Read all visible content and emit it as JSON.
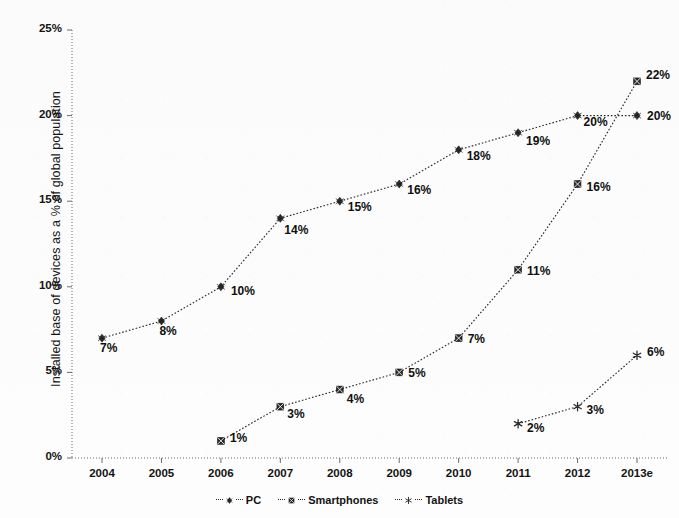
{
  "chart_data": {
    "type": "line",
    "title": "",
    "subtitle": "",
    "xlabel": "",
    "ylabel": "Installed base of devices as a % of global population",
    "categories": [
      "2004",
      "2005",
      "2006",
      "2007",
      "2008",
      "2009",
      "2010",
      "2011",
      "2012",
      "2013e"
    ],
    "xlim": [
      2004,
      2013
    ],
    "ylim": [
      0,
      25
    ],
    "ytick_labels": [
      "0%",
      "5%",
      "10%",
      "15%",
      "20%",
      "25%"
    ],
    "ytick_values": [
      0,
      5,
      10,
      15,
      20,
      25
    ],
    "grid": false,
    "legend_position": "bottom",
    "series": [
      {
        "name": "PC",
        "marker": "diamond",
        "line_style": "dotted",
        "color": "#2b2b2b",
        "values": [
          7,
          8,
          10,
          14,
          15,
          16,
          18,
          19,
          20,
          20
        ],
        "data_labels": [
          "7%",
          "8%",
          "10%",
          "14%",
          "15%",
          "16%",
          "18%",
          "19%",
          "20%",
          "20%"
        ]
      },
      {
        "name": "Smartphones",
        "marker": "cross-box",
        "line_style": "dotted",
        "color": "#2b2b2b",
        "values": [
          null,
          null,
          1,
          3,
          4,
          5,
          7,
          11,
          16,
          22
        ],
        "data_labels": [
          null,
          null,
          "1%",
          "3%",
          "4%",
          "5%",
          "7%",
          "11%",
          "16%",
          "22%"
        ]
      },
      {
        "name": "Tablets",
        "marker": "asterisk",
        "line_style": "dotted",
        "color": "#2b2b2b",
        "values": [
          null,
          null,
          null,
          null,
          null,
          null,
          null,
          2,
          3,
          6
        ],
        "data_labels": [
          null,
          null,
          null,
          null,
          null,
          null,
          null,
          "2%",
          "3%",
          "6%"
        ]
      }
    ]
  },
  "legend": {
    "items": [
      {
        "label": "PC"
      },
      {
        "label": "Smartphones"
      },
      {
        "label": "Tablets"
      }
    ]
  },
  "colors": {
    "ink": "#2b2b2b",
    "axis": "#6b6b6b",
    "background": "#fdfdfd"
  }
}
